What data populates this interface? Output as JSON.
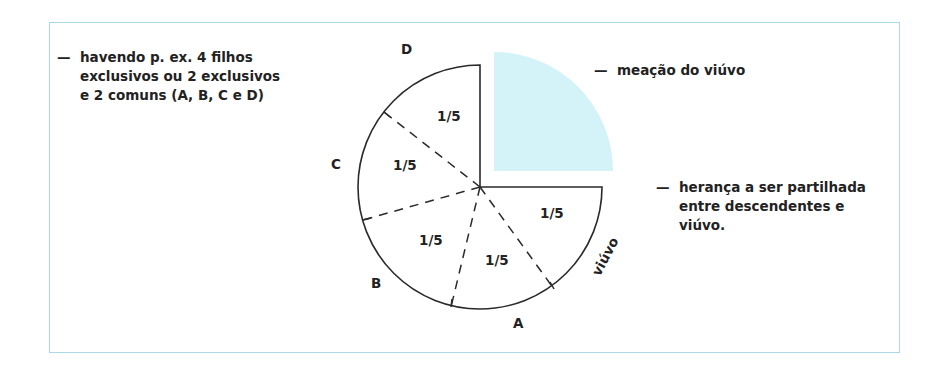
{
  "frame": {
    "border_color": "#a9d9e6"
  },
  "notes": {
    "children": {
      "dash": "—",
      "lines": [
        "havendo p. ex. 4 filhos",
        "exclusivos ou 2 exclusivos",
        "e 2 comuns (A, B, C e D)"
      ]
    },
    "meacao": {
      "dash": "—",
      "lines": [
        "meação do viúvo"
      ]
    },
    "heranca": {
      "dash": "—",
      "lines": [
        "herança a ser partilhada",
        "entre descendentes e",
        "viúvo."
      ]
    }
  },
  "diagram": {
    "meacao_color": "#d3f3f8",
    "stroke_color": "#2a2a2a",
    "sector_labels": [
      "D",
      "C",
      "B",
      "A",
      "viúvo"
    ],
    "fractions": [
      "1/5",
      "1/5",
      "1/5",
      "1/5",
      "1/5"
    ]
  }
}
